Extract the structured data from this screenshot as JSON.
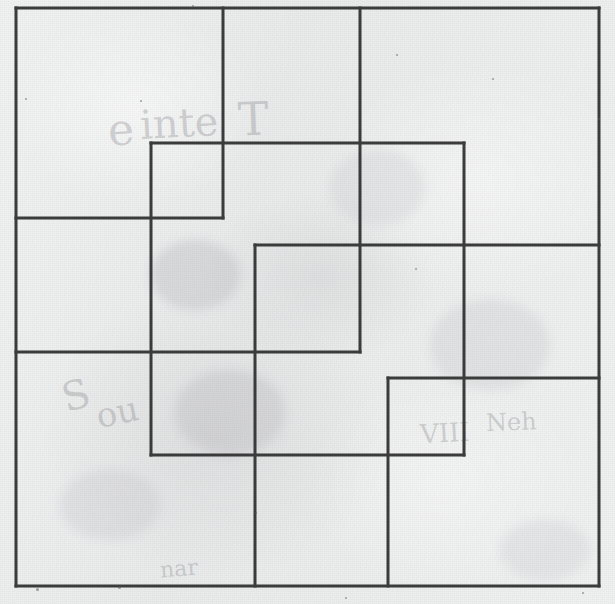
{
  "figure": {
    "medium": "scanned paper",
    "background_color": "#eceded",
    "ink_color": "#3b3b3b",
    "stroke_width": 3,
    "canvas": {
      "width": 615,
      "height": 604
    },
    "ghost_text": [
      {
        "text": "e",
        "x": 108,
        "y": 104,
        "size": 44,
        "rotate": -4
      },
      {
        "text": "inte",
        "x": 140,
        "y": 100,
        "size": 40,
        "rotate": -3
      },
      {
        "text": "T",
        "x": 238,
        "y": 92,
        "size": 46,
        "rotate": -2
      },
      {
        "text": "S",
        "x": 62,
        "y": 372,
        "size": 40,
        "rotate": -16
      },
      {
        "text": "ou",
        "x": 96,
        "y": 392,
        "size": 34,
        "rotate": -12
      },
      {
        "text": "VIII",
        "x": 420,
        "y": 418,
        "size": 26,
        "rotate": -3
      },
      {
        "text": "Neh",
        "x": 486,
        "y": 408,
        "size": 24,
        "rotate": -2
      },
      {
        "text": "nar",
        "x": 160,
        "y": 556,
        "size": 22,
        "rotate": -5
      }
    ],
    "smudges": [
      {
        "x": 150,
        "y": 240,
        "w": 90,
        "h": 70,
        "color": "rgba(172,172,178,0.30)"
      },
      {
        "x": 175,
        "y": 370,
        "w": 110,
        "h": 85,
        "color": "rgba(176,176,182,0.28)"
      },
      {
        "x": 430,
        "y": 300,
        "w": 120,
        "h": 90,
        "color": "rgba(182,182,188,0.22)"
      },
      {
        "x": 60,
        "y": 470,
        "w": 100,
        "h": 70,
        "color": "rgba(184,184,190,0.22)"
      },
      {
        "x": 330,
        "y": 150,
        "w": 95,
        "h": 75,
        "color": "rgba(186,186,192,0.20)"
      },
      {
        "x": 500,
        "y": 520,
        "w": 90,
        "h": 60,
        "color": "rgba(186,186,192,0.20)"
      }
    ],
    "specks": [
      {
        "x": 192,
        "y": 5,
        "d": 2
      },
      {
        "x": 396,
        "y": 54,
        "d": 2
      },
      {
        "x": 25,
        "y": 98,
        "d": 2
      },
      {
        "x": 140,
        "y": 100,
        "d": 2
      },
      {
        "x": 415,
        "y": 268,
        "d": 2
      },
      {
        "x": 255,
        "y": 512,
        "d": 2
      },
      {
        "x": 492,
        "y": 78,
        "d": 2
      },
      {
        "x": 598,
        "y": 118,
        "d": 2
      },
      {
        "x": 36,
        "y": 588,
        "d": 3
      },
      {
        "x": 582,
        "y": 592,
        "d": 2
      },
      {
        "x": 345,
        "y": 597,
        "d": 2
      },
      {
        "x": 118,
        "y": 586,
        "d": 3
      }
    ],
    "rectangles": [
      {
        "id": "rect-a",
        "label": "top-left-large",
        "x": 16,
        "y": 8,
        "w": 207,
        "h": 210
      },
      {
        "id": "rect-b",
        "label": "top-middle-tall",
        "x": 223,
        "y": 8,
        "w": 137,
        "h": 210
      },
      {
        "id": "rect-c",
        "label": "top-right-large",
        "x": 360,
        "y": 8,
        "w": 239,
        "h": 237
      },
      {
        "id": "rect-d",
        "label": "upper-center-small",
        "x": 151,
        "y": 143,
        "w": 313,
        "h": 312
      },
      {
        "id": "rect-e",
        "label": "center-square",
        "x": 255,
        "y": 245,
        "w": 105,
        "h": 107
      },
      {
        "id": "rect-f",
        "label": "left-middle-band",
        "x": 16,
        "y": 218,
        "w": 583,
        "h": 134
      },
      {
        "id": "rect-g",
        "label": "lower-right-small",
        "x": 388,
        "y": 378,
        "w": 76,
        "h": 77
      },
      {
        "id": "rect-h",
        "label": "bottom-left-large",
        "x": 16,
        "y": 352,
        "w": 239,
        "h": 234
      },
      {
        "id": "rect-i",
        "label": "bottom-center",
        "x": 255,
        "y": 455,
        "w": 133,
        "h": 131
      },
      {
        "id": "rect-j",
        "label": "bottom-right-large",
        "x": 388,
        "y": 378,
        "w": 211,
        "h": 208
      },
      {
        "id": "rect-k",
        "label": "outer-frame",
        "x": 16,
        "y": 8,
        "w": 583,
        "h": 578
      }
    ],
    "segments": {
      "vertical": [
        {
          "id": "v-left-edge",
          "x": 16,
          "y1": 8,
          "y2": 586
        },
        {
          "id": "v-151",
          "x": 151,
          "y1": 143,
          "y2": 455
        },
        {
          "id": "v-223",
          "x": 223,
          "y1": 8,
          "y2": 218
        },
        {
          "id": "v-255",
          "x": 255,
          "y1": 245,
          "y2": 586
        },
        {
          "id": "v-360",
          "x": 360,
          "y1": 8,
          "y2": 352
        },
        {
          "id": "v-388",
          "x": 388,
          "y1": 378,
          "y2": 586
        },
        {
          "id": "v-464",
          "x": 464,
          "y1": 143,
          "y2": 455
        },
        {
          "id": "v-right-edge",
          "x": 599,
          "y1": 8,
          "y2": 586
        }
      ],
      "horizontal": [
        {
          "id": "h-top-edge",
          "y": 8,
          "x1": 16,
          "x2": 599
        },
        {
          "id": "h-143",
          "y": 143,
          "x1": 151,
          "x2": 464
        },
        {
          "id": "h-218",
          "y": 218,
          "x1": 16,
          "x2": 223
        },
        {
          "id": "h-245",
          "y": 245,
          "x1": 255,
          "x2": 599
        },
        {
          "id": "h-352",
          "y": 352,
          "x1": 16,
          "x2": 360
        },
        {
          "id": "h-378",
          "y": 378,
          "x1": 388,
          "x2": 599
        },
        {
          "id": "h-455",
          "y": 455,
          "x1": 151,
          "x2": 464
        },
        {
          "id": "h-bottom-edge",
          "y": 586,
          "x1": 16,
          "x2": 599
        }
      ]
    }
  }
}
